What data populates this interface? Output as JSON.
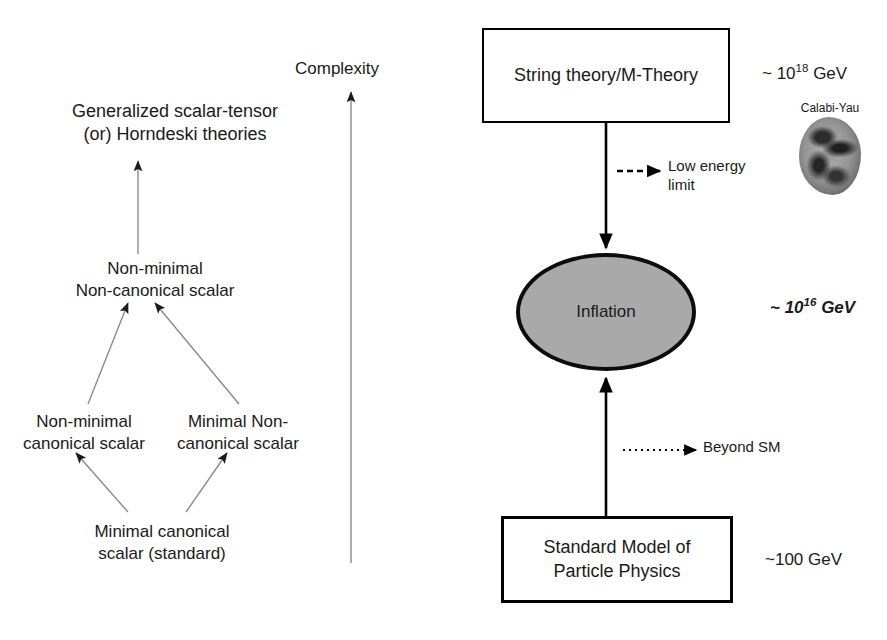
{
  "figure": {
    "left_panel": {
      "axis": {
        "label": "Complexity"
      },
      "nodes": {
        "horndeski": "Generalized scalar-tensor\n(or) Horndeski theories",
        "nonminimal_noncanonical": "Non-minimal\nNon-canonical scalar",
        "nonminimal_canonical": "Non-minimal\ncanonical scalar",
        "minimal_noncanonical": "Minimal Non-\ncanonical scalar",
        "minimal_canonical": "Minimal canonical\nscalar (standard)"
      }
    },
    "right_panel": {
      "boxes": {
        "string_theory": "String theory/M-Theory",
        "standard_model": "Standard Model of\nParticle Physics"
      },
      "ellipse": {
        "inflation": "Inflation"
      },
      "scales": {
        "string_theory": {
          "prefix": "~ 10",
          "exponent": "18",
          "unit": " GeV"
        },
        "inflation": {
          "prefix": "~ 10",
          "exponent": "16",
          "unit": " GeV"
        },
        "standard_model": {
          "prefix": "~100",
          "exponent": "",
          "unit": " GeV"
        }
      },
      "annotations": {
        "low_energy_limit": "Low energy\nlimit",
        "beyond_sm": "Beyond SM"
      },
      "image": {
        "caption": "Calabi-Yau"
      }
    },
    "colors": {
      "stroke": "#000000",
      "ellipse_fill": "#a9a9a9",
      "thin_arrow": "#8a8a8a",
      "text": "#1a1a1a"
    }
  }
}
